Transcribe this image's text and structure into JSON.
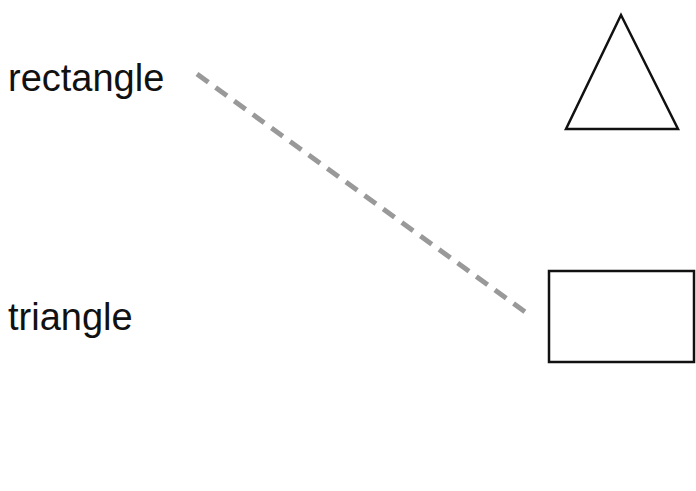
{
  "exercise": {
    "words": [
      {
        "label": "rectangle"
      },
      {
        "label": "triangle"
      }
    ],
    "shapes": [
      {
        "name": "triangle"
      },
      {
        "name": "rectangle"
      }
    ],
    "connection": {
      "from": "rectangle",
      "to": "rectangle-shape",
      "style": "dashed",
      "color": "#999999"
    }
  }
}
